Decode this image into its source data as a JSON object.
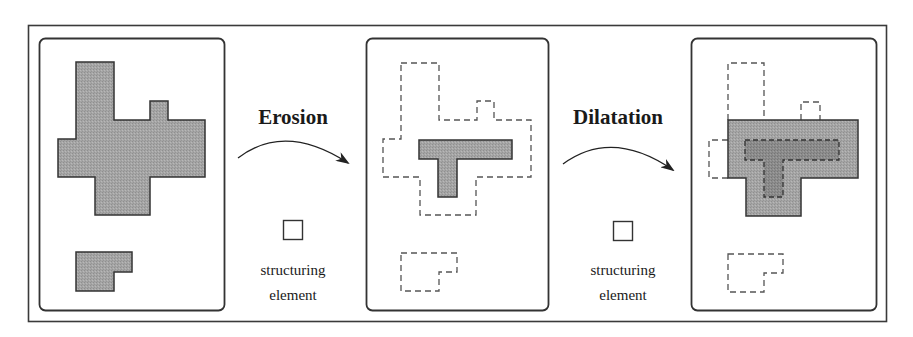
{
  "diagram": {
    "operations": [
      {
        "name": "Erosion",
        "structuring_label_line1": "structuring",
        "structuring_label_line2": "element"
      },
      {
        "name": "Dilatation",
        "structuring_label_line1": "structuring",
        "structuring_label_line2": "element"
      }
    ],
    "panels": [
      {
        "id": "original",
        "description": "Original binary shapes (filled gray)"
      },
      {
        "id": "eroded",
        "description": "Eroded result (filled T) with original outline dashed"
      },
      {
        "id": "dilated",
        "description": "Dilated result (filled) with eroded T dashed and original outline dashed"
      }
    ],
    "colors": {
      "shape_fill": "#a3a3a3",
      "shape_fill_dark": "#8a8a8a",
      "stroke": "#333333",
      "frame": "#3a3a3a",
      "background": "#ffffff"
    }
  }
}
